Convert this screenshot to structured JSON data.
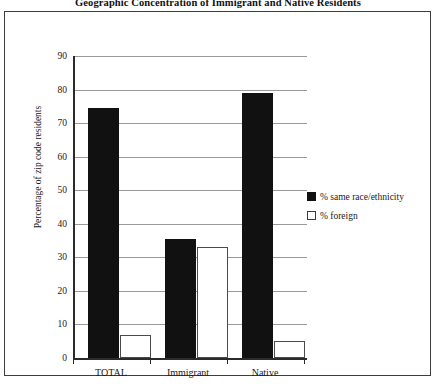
{
  "chart_data": {
    "type": "bar",
    "title": "Geographic Concentration of Immigrant and Native Residents",
    "xlabel": "",
    "ylabel": "Percentage of zip code residents",
    "categories": [
      "TOTAL",
      "Immigrant",
      "Native"
    ],
    "series": [
      {
        "name": "% same race/ethnicity",
        "values": [
          74.5,
          35.5,
          79
        ],
        "color": "#111111",
        "style": "filled"
      },
      {
        "name": "% foreign",
        "values": [
          7,
          33,
          5
        ],
        "color": "#ffffff",
        "style": "outlined"
      }
    ],
    "ylim": [
      0,
      90
    ],
    "yticks": [
      0,
      10,
      20,
      30,
      40,
      50,
      60,
      70,
      80,
      90
    ],
    "ytick_labels": [
      "0",
      "10",
      "20",
      "30",
      "40",
      "50",
      "60",
      "70",
      "80",
      "90"
    ],
    "grid": "horizontal",
    "legend_position": "right-middle"
  },
  "frame": {
    "border_color": "#3d3d3d",
    "background": "#ffffff"
  }
}
